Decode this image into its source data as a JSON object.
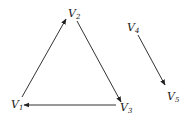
{
  "diagram": {
    "type": "directed-graph",
    "colors": {
      "edge": "#333333",
      "label": "#222222",
      "background": "#ffffff"
    },
    "nodes": [
      {
        "id": "V1",
        "letter": "V",
        "sub": "1",
        "x": 11,
        "y": 108
      },
      {
        "id": "V2",
        "letter": "V",
        "sub": "2",
        "x": 68,
        "y": 17
      },
      {
        "id": "V3",
        "letter": "V",
        "sub": "3",
        "x": 120,
        "y": 111
      },
      {
        "id": "V4",
        "letter": "V",
        "sub": "4",
        "x": 127,
        "y": 31
      },
      {
        "id": "V5",
        "letter": "V",
        "sub": "5",
        "x": 167,
        "y": 100
      }
    ],
    "edges": [
      {
        "from": "V1",
        "to": "V2",
        "x1": 22,
        "y1": 97,
        "x2": 66,
        "y2": 19
      },
      {
        "from": "V2",
        "to": "V3",
        "x1": 77,
        "y1": 21,
        "x2": 121,
        "y2": 102
      },
      {
        "from": "V3",
        "to": "V1",
        "x1": 116,
        "y1": 105,
        "x2": 24,
        "y2": 105
      },
      {
        "from": "V4",
        "to": "V5",
        "x1": 138,
        "y1": 35,
        "x2": 165,
        "y2": 85
      }
    ]
  }
}
